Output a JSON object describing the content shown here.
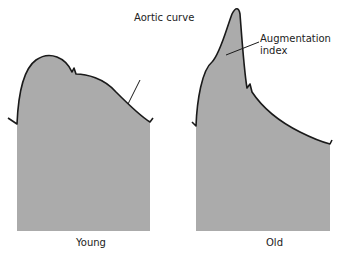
{
  "diagram": {
    "title": "Aortic curve",
    "annotation": "Augmentation\nindex",
    "annotation_lines": [
      "Augmentation",
      "index"
    ],
    "panels": [
      {
        "label": "Young",
        "description": "Rounded systolic peak with early shoulder, small dicrotic notch, gradual diastolic decline; reflected wave arrives late (arrow on descending limb)"
      },
      {
        "label": "Old",
        "description": "Tall sharp late-systolic peak due to early wave reflection (augmentation), dicrotic notch then steep exponential diastolic decay"
      }
    ],
    "colors": {
      "fill": "#ababab",
      "stroke": "#1a1a1a",
      "text": "#222222",
      "background": "#ffffff"
    }
  }
}
